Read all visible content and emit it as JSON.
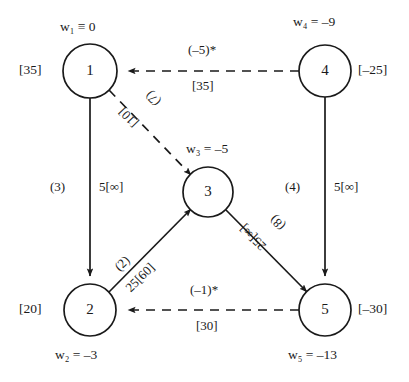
{
  "figure": {
    "type": "network-flow-diagram"
  },
  "nodes": [
    {
      "id": "1",
      "potential_prefix": "w",
      "potential_sub": "1",
      "potential_rel": "≡",
      "potential_value": "0",
      "potential_text": "w₁ ≡ 0",
      "bracket": "[35]",
      "cx": 90,
      "cy": 71,
      "r": 27
    },
    {
      "id": "2",
      "potential_prefix": "w",
      "potential_sub": "2",
      "potential_rel": "=",
      "potential_value": "–3",
      "potential_text": "w₂ = –3",
      "bracket": "[20]",
      "cx": 90,
      "cy": 310,
      "r": 26
    },
    {
      "id": "3",
      "potential_prefix": "w",
      "potential_sub": "3",
      "potential_rel": "=",
      "potential_value": "–5",
      "potential_text": "w₃ = –5",
      "bracket": "",
      "cx": 208,
      "cy": 192,
      "r": 25
    },
    {
      "id": "4",
      "potential_prefix": "w",
      "potential_sub": "4",
      "potential_rel": "=",
      "potential_value": "–9",
      "potential_text": "w₄ = –9",
      "bracket": "[–25]",
      "cx": 325,
      "cy": 71,
      "r": 26
    },
    {
      "id": "5",
      "potential_prefix": "w",
      "potential_sub": "5",
      "potential_rel": "=",
      "potential_value": "–13",
      "potential_text": "w₅ = –13",
      "bracket": "[–30]",
      "cx": 325,
      "cy": 310,
      "r": 26
    }
  ],
  "arcs": [
    {
      "name": "arc-4-to-1",
      "from": "4",
      "to": "1",
      "style": "dashed",
      "cost_label": "(–5)*",
      "flow_label": "[35]"
    },
    {
      "name": "arc-1-to-2",
      "from": "1",
      "to": "2",
      "style": "solid",
      "cost_label": "(3)",
      "flow_label": "5[∞]"
    },
    {
      "name": "arc-1-to-3",
      "from": "1",
      "to": "3",
      "style": "dashed",
      "cost_label": "(7)",
      "flow_label": "[10]"
    },
    {
      "name": "arc-2-to-3",
      "from": "2",
      "to": "3",
      "style": "solid",
      "cost_label": "(2)",
      "flow_label": "25[60]"
    },
    {
      "name": "arc-3-to-5",
      "from": "3",
      "to": "5",
      "style": "solid",
      "cost_label": "(8)",
      "flow_label": "25[∞]"
    },
    {
      "name": "arc-4-to-5",
      "from": "4",
      "to": "5",
      "style": "solid",
      "cost_label": "(4)",
      "flow_label": "5[∞]"
    },
    {
      "name": "arc-5-to-2",
      "from": "5",
      "to": "2",
      "style": "dashed",
      "cost_label": "(–1)*",
      "flow_label": "[30]"
    }
  ],
  "colors": {
    "ink": "#1a1a1a",
    "background": "#ffffff"
  }
}
